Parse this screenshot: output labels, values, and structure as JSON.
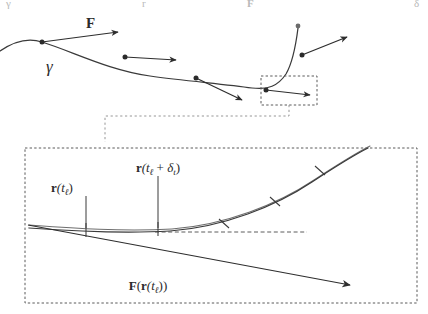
{
  "figure": {
    "kind": "vector-field-along-curve-diagram",
    "background_color": "#ffffff",
    "stroke_color": "#2e2e2e",
    "dash_color": "#5a5a5a",
    "width": 428,
    "height": 314,
    "cutoff_top_glyphs": [
      {
        "text": "γ",
        "x": 6
      },
      {
        "text": "r",
        "x": 142
      },
      {
        "text": "F",
        "x": 247
      },
      {
        "text": "δ",
        "x": 414
      }
    ]
  },
  "top_panel": {
    "name": "trajectory-overview",
    "curve": {
      "label": "γ",
      "label_x": 46,
      "label_y": 72,
      "path": "M -4 54 C 14 40 30 38 42 42 C 74 52 108 70 150 76 C 186 81 224 84 252 88 C 268 90 278 86 286 74 C 293 62 296 44 298 28"
    },
    "end_dot": {
      "x": 298,
      "y": 26,
      "r": 2.4
    },
    "force_label": {
      "text": "F",
      "x": 86,
      "y": 28
    },
    "vectors": [
      {
        "name": "force-vector-1",
        "x1": 42,
        "y1": 42,
        "x2": 118,
        "y2": 32
      },
      {
        "name": "force-vector-2",
        "x1": 125,
        "y1": 57,
        "x2": 176,
        "y2": 60
      },
      {
        "name": "force-vector-3",
        "x1": 196,
        "y1": 78,
        "x2": 242,
        "y2": 100
      },
      {
        "name": "force-vector-4",
        "x1": 266,
        "y1": 90,
        "x2": 310,
        "y2": 95
      },
      {
        "name": "force-vector-5",
        "x1": 302,
        "y1": 55,
        "x2": 347,
        "y2": 37
      }
    ],
    "nodes": [
      {
        "name": "sample-point-1",
        "x": 42,
        "y": 42
      },
      {
        "name": "sample-point-2",
        "x": 125,
        "y": 57
      },
      {
        "name": "sample-point-3",
        "x": 196,
        "y": 78
      },
      {
        "name": "sample-point-4",
        "x": 266,
        "y": 90
      },
      {
        "name": "sample-point-5",
        "x": 302,
        "y": 55
      }
    ],
    "zoom_box": {
      "x": 261,
      "y": 76,
      "width": 56,
      "height": 29
    },
    "connector_path": "M 289 105 L 289 116 L 105 116 L 105 142"
  },
  "bottom_panel": {
    "name": "zoomed-detail-panel",
    "frame": {
      "x": 25,
      "y": 148,
      "width": 392,
      "height": 155
    },
    "curve_main_path": "M 29 228 C 70 231 120 234 170 231 C 224 227 276 206 312 182 C 338 165 356 154 368 148",
    "curve_shadow_path": "M 29 225 C 70 228 122 232 172 229 C 226 225 278 204 314 180 C 340 163 358 152 370 146",
    "chord": {
      "x1": 28,
      "y1": 225,
      "x2": 350,
      "y2": 285
    },
    "guide_line": {
      "x1": 155,
      "y1": 232,
      "x2": 307,
      "y2": 232
    },
    "ticks": [
      {
        "name": "tick-t-ell",
        "x1": 86,
        "y1": 223,
        "x2": 86,
        "y2": 237
      },
      {
        "name": "tick-t-ell-plus-delta",
        "x1": 158,
        "y1": 222,
        "x2": 158,
        "y2": 236
      },
      {
        "name": "tick-seg-3",
        "x1": 219,
        "y1": 219,
        "x2": 229,
        "y2": 228
      },
      {
        "name": "tick-seg-4",
        "x1": 270,
        "y1": 197,
        "x2": 280,
        "y2": 206
      },
      {
        "name": "tick-seg-5",
        "x1": 315,
        "y1": 166,
        "x2": 325,
        "y2": 175
      }
    ],
    "stems": [
      {
        "name": "stem-t-ell",
        "x1": 86,
        "y1": 196,
        "x2": 86,
        "y2": 228
      },
      {
        "name": "stem-t-ell-plus-delta",
        "x1": 158,
        "y1": 176,
        "x2": 158,
        "y2": 228
      }
    ],
    "labels": {
      "r_t": {
        "text_bold": "r",
        "text_rest": "(t",
        "sub": "ℓ",
        "close": ")",
        "x": 62,
        "y": 190
      },
      "r_t_delta": {
        "text_bold": "r",
        "open": "(t",
        "sub1": "ℓ",
        "plus": " + ",
        "delta": "δ",
        "sub2": "t",
        "close": ")",
        "x": 104,
        "y": 170
      },
      "force_of_r": {
        "bold_f": "F",
        "open": "(",
        "bold_r": "r",
        "open2": "(t",
        "sub": "ℓ",
        "close": "))",
        "x": 148,
        "y": 288
      }
    }
  }
}
